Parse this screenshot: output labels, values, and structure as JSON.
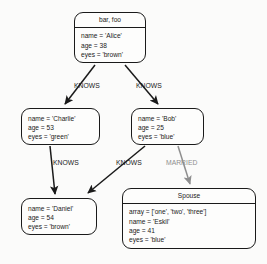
{
  "diagram": {
    "type": "property-graph",
    "background_color": "#fbfbfa",
    "stroke_color": "#1a1a1a",
    "muted_label_color": "#8e8e8e",
    "nodes": [
      {
        "id": "alice",
        "header": "bar, foo",
        "has_header": true,
        "properties": [
          "name = 'Alice'",
          "age = 38",
          "eyes = 'brown'"
        ]
      },
      {
        "id": "charlie",
        "header": "",
        "has_header": false,
        "properties": [
          "name = 'Charlie'",
          "age = 53",
          "eyes = 'green'"
        ]
      },
      {
        "id": "bob",
        "header": "",
        "has_header": false,
        "properties": [
          "name = 'Bob'",
          "age = 25",
          "eyes = 'blue'"
        ]
      },
      {
        "id": "daniel",
        "header": "",
        "has_header": false,
        "properties": [
          "name = 'Daniel'",
          "age = 54",
          "eyes = 'brown'"
        ]
      },
      {
        "id": "eskil",
        "header": "Spouse",
        "has_header": true,
        "properties": [
          "array = ['one', 'two', 'three']",
          "name = 'Eskil'",
          "age = 41",
          "eyes = 'blue'"
        ]
      }
    ],
    "edges": [
      {
        "id": "alice-charlie",
        "label": "KNOWS",
        "from": "alice",
        "to": "charlie",
        "muted": false
      },
      {
        "id": "alice-bob",
        "label": "KNOWS",
        "from": "alice",
        "to": "bob",
        "muted": false
      },
      {
        "id": "charlie-daniel",
        "label": "KNOWS",
        "from": "charlie",
        "to": "daniel",
        "muted": false
      },
      {
        "id": "bob-daniel",
        "label": "KNOWS",
        "from": "bob",
        "to": "daniel",
        "muted": false
      },
      {
        "id": "bob-eskil",
        "label": "MARRIED",
        "from": "bob",
        "to": "eskil",
        "muted": true
      }
    ]
  }
}
